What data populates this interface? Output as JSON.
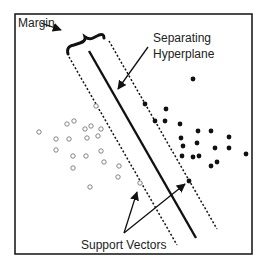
{
  "labels": {
    "margin": "Margin",
    "hyperplane_line1": "Separating",
    "hyperplane_line2": "Hyperplane",
    "support_vectors": "Support Vectors"
  },
  "colors": {
    "border": "#111111",
    "line": "#111111",
    "hollow_point": "#777777",
    "filled_point": "#111111",
    "text": "#222222"
  },
  "class_negative_points": [
    [
      39,
      132
    ],
    [
      56,
      139
    ],
    [
      67,
      124
    ],
    [
      74,
      121
    ],
    [
      56,
      150
    ],
    [
      69,
      139
    ],
    [
      85,
      129
    ],
    [
      91,
      126
    ],
    [
      101,
      129
    ],
    [
      87,
      138
    ],
    [
      98,
      136
    ],
    [
      101,
      151
    ],
    [
      73,
      156
    ],
    [
      86,
      156
    ],
    [
      73,
      168
    ],
    [
      104,
      162
    ],
    [
      119,
      166
    ],
    [
      118,
      177
    ],
    [
      90,
      187
    ],
    [
      96,
      106
    ],
    [
      140,
      183
    ]
  ],
  "class_positive_points": [
    [
      145,
      104
    ],
    [
      166,
      109
    ],
    [
      155,
      121
    ],
    [
      165,
      121
    ],
    [
      180,
      124
    ],
    [
      198,
      131
    ],
    [
      211,
      131
    ],
    [
      181,
      138
    ],
    [
      229,
      137
    ],
    [
      183,
      146
    ],
    [
      197,
      143
    ],
    [
      215,
      148
    ],
    [
      229,
      148
    ],
    [
      182,
      156
    ],
    [
      193,
      157
    ],
    [
      199,
      156
    ],
    [
      246,
      154
    ],
    [
      211,
      166
    ],
    [
      217,
      162
    ],
    [
      193,
      79
    ],
    [
      189,
      181
    ]
  ],
  "support_vectors": {
    "negative": [
      140,
      183
    ],
    "positive": [
      189,
      181
    ]
  }
}
